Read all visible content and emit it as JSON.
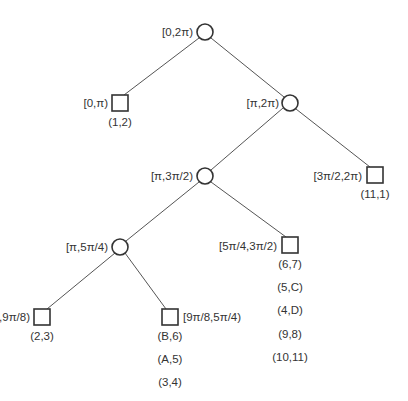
{
  "diagram": {
    "type": "interval-tree",
    "nodes": [
      {
        "id": "root",
        "shape": "circle",
        "interval": "[0,2π)",
        "label_side": "left",
        "pairs": []
      },
      {
        "id": "n0",
        "shape": "square",
        "interval": "[0,π)",
        "label_side": "left",
        "pairs": [
          "(1,2)"
        ]
      },
      {
        "id": "n1",
        "shape": "circle",
        "interval": "[π,2π)",
        "label_side": "left",
        "pairs": []
      },
      {
        "id": "n10",
        "shape": "circle",
        "interval": "[π,3π/2)",
        "label_side": "left",
        "pairs": []
      },
      {
        "id": "n11",
        "shape": "square",
        "interval": "[3π/2,2π)",
        "label_side": "left",
        "pairs": [
          "(11,1)"
        ]
      },
      {
        "id": "n100",
        "shape": "circle",
        "interval": "[π,5π/4)",
        "label_side": "left",
        "pairs": []
      },
      {
        "id": "n101",
        "shape": "square",
        "interval": "[5π/4,3π/2)",
        "label_side": "left",
        "pairs": [
          "(6,7)",
          "(5,C)",
          "(4,D)",
          "(9,8)",
          "(10,11)"
        ]
      },
      {
        "id": "n1000",
        "shape": "square",
        "interval": "[π,9π/8)",
        "label_side": "left",
        "pairs": [
          "(2,3)"
        ]
      },
      {
        "id": "n1001",
        "shape": "square",
        "interval": "[9π/8,5π/4)",
        "label_side": "right",
        "pairs": [
          "(B,6)",
          "(A,5)",
          "(3,4)"
        ]
      }
    ],
    "edges": [
      [
        "root",
        "n0"
      ],
      [
        "root",
        "n1"
      ],
      [
        "n1",
        "n10"
      ],
      [
        "n1",
        "n11"
      ],
      [
        "n10",
        "n100"
      ],
      [
        "n10",
        "n101"
      ],
      [
        "n100",
        "n1000"
      ],
      [
        "n100",
        "n1001"
      ]
    ]
  },
  "labels": {
    "root": "[0,2π)",
    "n0": "[0,π)",
    "n1": "[π,2π)",
    "n10": "[π,3π/2)",
    "n11": "[3π/2,2π)",
    "n100": "[π,5π/4)",
    "n101": "[5π/4,3π/2)",
    "n1000": "[π,9π/8)",
    "n1001": "[9π/8,5π/4)"
  },
  "pairs": {
    "n0": [
      "(1,2)"
    ],
    "n11": [
      "(11,1)"
    ],
    "n101": [
      "(6,7)",
      "(5,C)",
      "(4,D)",
      "(9,8)",
      "(10,11)"
    ],
    "n1000": [
      "(2,3)"
    ],
    "n1001": [
      "(B,6)",
      "(A,5)",
      "(3,4)"
    ]
  },
  "colors": {
    "stroke": "#333333",
    "edge": "#555555",
    "text": "#333333",
    "background": "#ffffff"
  }
}
